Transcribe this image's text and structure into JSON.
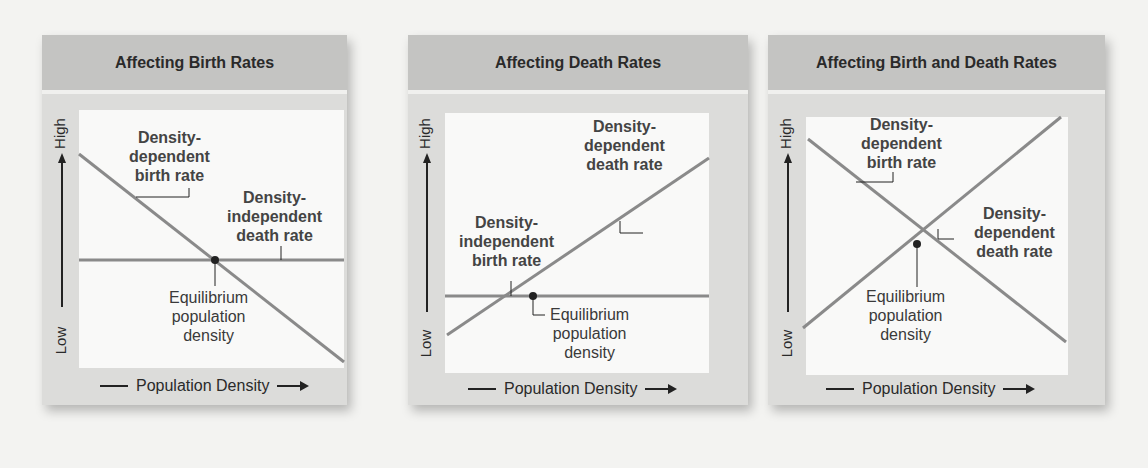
{
  "panels": [
    {
      "title": "Affecting Birth Rates",
      "y_axis": {
        "high": "High",
        "low": "Low"
      },
      "x_axis": {
        "label": "Population Density"
      },
      "labels": {
        "line_a": "Density-\ndependent\nbirth rate",
        "line_b": "Density-\nindependent\ndeath rate",
        "equilibrium": "Equilibrium\npopulation\ndensity"
      }
    },
    {
      "title": "Affecting Death Rates",
      "y_axis": {
        "high": "High",
        "low": "Low"
      },
      "x_axis": {
        "label": "Population Density"
      },
      "labels": {
        "line_a": "Density-\ndependent\ndeath rate",
        "line_b": "Density-\nindependent\nbirth rate",
        "equilibrium": "Equilibrium\npopulation\ndensity"
      }
    },
    {
      "title": "Affecting Birth and Death Rates",
      "y_axis": {
        "high": "High",
        "low": "Low"
      },
      "x_axis": {
        "label": "Population Density"
      },
      "labels": {
        "line_a": "Density-\ndependent\nbirth rate",
        "line_b": "Density-\ndependent\ndeath rate",
        "equilibrium": "Equilibrium\npopulation\ndensity"
      }
    }
  ],
  "colors": {
    "line": "#8a8a8a",
    "header_bg": "#c4c4c2",
    "panel_bg": "#dcdcda",
    "plot_bg": "#f9f9f8",
    "point": "#222222"
  }
}
